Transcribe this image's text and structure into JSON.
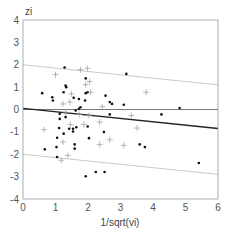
{
  "chart_data": {
    "type": "scatter",
    "title": "",
    "xlabel": "1/sqrt(vi)",
    "ylabel": "zi",
    "xlim": [
      0,
      6
    ],
    "ylim": [
      -4,
      4
    ],
    "x_ticks": [
      "0",
      "1",
      "2",
      "3",
      "4",
      "5",
      "6"
    ],
    "y_ticks": [
      "4",
      "3",
      "2",
      "1",
      "0",
      "-1",
      "-2",
      "-3",
      "-4"
    ],
    "grid": false,
    "legend": null,
    "reference_lines": [
      {
        "name": "zero-line",
        "x": [
          0,
          6
        ],
        "y": [
          0,
          0
        ],
        "color": "#555555"
      },
      {
        "name": "regression-line",
        "x": [
          0,
          6
        ],
        "y": [
          0.05,
          -0.85
        ],
        "color": "#222222"
      },
      {
        "name": "upper-band",
        "x": [
          0,
          6
        ],
        "y": [
          2.0,
          1.1
        ],
        "color": "#bbbbbb"
      },
      {
        "name": "lower-band",
        "x": [
          0,
          6
        ],
        "y": [
          -2.0,
          -2.9
        ],
        "color": "#bbbbbb"
      }
    ],
    "series": [
      {
        "name": "dots",
        "marker": "dot",
        "color": "#111111",
        "points": [
          [
            1.28,
            1.88
          ],
          [
            0.59,
            0.73
          ],
          [
            0.9,
            0.55
          ],
          [
            0.92,
            0.4
          ],
          [
            1.31,
            1.07
          ],
          [
            1.33,
            1.0
          ],
          [
            1.25,
            0.77
          ],
          [
            1.93,
            1.39
          ],
          [
            3.18,
            1.59
          ],
          [
            4.82,
            0.07
          ],
          [
            4.26,
            -0.22
          ],
          [
            2.54,
            0.62
          ],
          [
            2.67,
            0.33
          ],
          [
            2.74,
            0.25
          ],
          [
            3.1,
            0.21
          ],
          [
            2.67,
            -0.22
          ],
          [
            3.59,
            -1.56
          ],
          [
            3.75,
            -1.68
          ],
          [
            5.41,
            -2.39
          ],
          [
            0.67,
            -1.78
          ],
          [
            1.03,
            -1.68
          ],
          [
            1.05,
            -1.26
          ],
          [
            1.13,
            -0.19
          ],
          [
            1.13,
            -0.42
          ],
          [
            1.11,
            -0.83
          ],
          [
            1.31,
            -0.34
          ],
          [
            1.05,
            -2.12
          ],
          [
            1.93,
            -2.98
          ],
          [
            2.24,
            -2.79
          ],
          [
            2.51,
            -2.79
          ],
          [
            2.03,
            -1.28
          ],
          [
            2.49,
            -1.01
          ],
          [
            1.59,
            -1.56
          ],
          [
            1.59,
            -1.75
          ],
          [
            1.54,
            -0.98
          ],
          [
            1.54,
            -0.86
          ],
          [
            1.25,
            -1.08
          ],
          [
            1.42,
            -0.86
          ],
          [
            1.64,
            -0.79
          ],
          [
            1.72,
            0.03
          ],
          [
            1.77,
            0.1
          ],
          [
            1.91,
            0.4
          ],
          [
            1.93,
            0.73
          ],
          [
            1.99,
            0.77
          ],
          [
            1.56,
            0.52
          ],
          [
            1.72,
            0.47
          ],
          [
            1.99,
            -0.76
          ],
          [
            1.62,
            -0.04
          ]
        ]
      },
      {
        "name": "crosses",
        "marker": "plus",
        "color": "#999999",
        "points": [
          [
            1.0,
            1.56
          ],
          [
            1.77,
            1.78
          ],
          [
            1.98,
            1.84
          ],
          [
            2.05,
            1.25
          ],
          [
            1.93,
            1.11
          ],
          [
            2.08,
            0.77
          ],
          [
            1.44,
            0.33
          ],
          [
            1.23,
            0.25
          ],
          [
            1.49,
            0.7
          ],
          [
            3.79,
            0.77
          ],
          [
            2.44,
            0.13
          ],
          [
            3.33,
            -0.27
          ],
          [
            3.51,
            -0.83
          ],
          [
            2.36,
            -0.56
          ],
          [
            2.36,
            -1.56
          ],
          [
            2.67,
            -1.35
          ],
          [
            3.1,
            -1.6
          ],
          [
            0.65,
            -0.9
          ],
          [
            1.23,
            -1.45
          ],
          [
            1.38,
            -2.05
          ],
          [
            1.18,
            -2.27
          ],
          [
            2.03,
            -0.27
          ],
          [
            1.74,
            -0.22
          ],
          [
            1.87,
            -0.67
          ],
          [
            1.46,
            -0.67
          ],
          [
            1.31,
            -0.12
          ]
        ]
      }
    ]
  }
}
